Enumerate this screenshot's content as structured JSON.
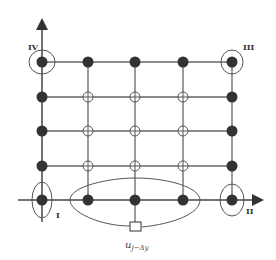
{
  "diagram": {
    "type": "grid-stencil",
    "grid": {
      "columns_x": [
        42,
        88,
        135,
        183,
        232
      ],
      "rows_y": [
        62,
        97,
        131,
        166,
        200
      ],
      "boundary_node": "filled",
      "interior_node": "open-circle-with-cross"
    },
    "axes": {
      "x_arrow_end": 262,
      "y_arrow_top": 20
    },
    "corner_labels": {
      "top_left": "IV",
      "top_right": "III",
      "bottom_left": "I",
      "bottom_right": "II"
    },
    "bottom_marker_label": "u",
    "bottom_marker_subscript": "j−Δy",
    "colors": {
      "line": "#555555",
      "node": "#333333",
      "background": "#ffffff"
    }
  }
}
